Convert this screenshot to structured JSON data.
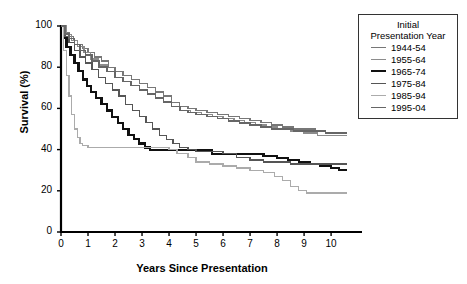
{
  "chart_data": {
    "type": "line",
    "title": "",
    "xlabel": "Years Since Presentation",
    "ylabel": "Survival (%)",
    "xlim": [
      0,
      10.7
    ],
    "ylim": [
      0,
      100
    ],
    "xticks": [
      "0",
      "1",
      "2",
      "3",
      "4",
      "5",
      "6",
      "7",
      "8",
      "9",
      "10"
    ],
    "yticks": [
      "0",
      "20",
      "40",
      "60",
      "80",
      "100"
    ],
    "grid": false,
    "step_style": "post",
    "legend": {
      "position": "top-right",
      "title_line1": "Initial",
      "title_line2": "Presentation Year",
      "entries": [
        {
          "label": "1944-54",
          "color": "#777777",
          "width": 1.3
        },
        {
          "label": "1955-64",
          "color": "#8c8c8c",
          "width": 1.3
        },
        {
          "label": "1965-74",
          "color": "#111111",
          "width": 2.2
        },
        {
          "label": "1975-84",
          "color": "#555555",
          "width": 1.3
        },
        {
          "label": "1985-94",
          "color": "#ababab",
          "width": 1.3
        },
        {
          "label": "1995-04",
          "color": "#666666",
          "width": 1.5
        }
      ]
    },
    "series": [
      {
        "name": "1944-54",
        "color": "#777777",
        "width": 1.3,
        "points": [
          [
            0,
            100
          ],
          [
            0.15,
            97
          ],
          [
            0.3,
            95
          ],
          [
            0.45,
            93
          ],
          [
            0.6,
            91
          ],
          [
            0.8,
            89
          ],
          [
            1.0,
            87
          ],
          [
            1.25,
            85
          ],
          [
            1.5,
            83
          ],
          [
            1.75,
            80
          ],
          [
            2.0,
            78
          ],
          [
            2.3,
            76
          ],
          [
            2.6,
            74
          ],
          [
            2.9,
            72
          ],
          [
            3.2,
            70
          ],
          [
            3.5,
            68
          ],
          [
            3.8,
            66
          ],
          [
            4.1,
            63
          ],
          [
            4.4,
            61
          ],
          [
            4.7,
            60
          ],
          [
            5.0,
            59
          ],
          [
            5.4,
            58
          ],
          [
            5.8,
            57
          ],
          [
            6.2,
            56
          ],
          [
            6.6,
            55
          ],
          [
            7.0,
            54
          ],
          [
            7.4,
            53
          ],
          [
            7.8,
            52
          ],
          [
            8.2,
            51
          ],
          [
            8.6,
            50
          ],
          [
            9.0,
            50
          ],
          [
            9.4,
            49
          ],
          [
            9.8,
            48
          ],
          [
            10.2,
            48
          ],
          [
            10.6,
            48
          ]
        ]
      },
      {
        "name": "1955-64",
        "color": "#8c8c8c",
        "width": 1.3,
        "points": [
          [
            0,
            100
          ],
          [
            0.2,
            96
          ],
          [
            0.4,
            93
          ],
          [
            0.6,
            90
          ],
          [
            0.85,
            87
          ],
          [
            1.1,
            84
          ],
          [
            1.4,
            81
          ],
          [
            1.7,
            78
          ],
          [
            2.0,
            75
          ],
          [
            2.3,
            73
          ],
          [
            2.6,
            71
          ],
          [
            2.9,
            69
          ],
          [
            3.2,
            67
          ],
          [
            3.5,
            65
          ],
          [
            3.8,
            63
          ],
          [
            4.1,
            61
          ],
          [
            4.4,
            59
          ],
          [
            4.8,
            58
          ],
          [
            5.2,
            57
          ],
          [
            5.6,
            56
          ],
          [
            6.0,
            55
          ],
          [
            6.4,
            54
          ],
          [
            6.8,
            53
          ],
          [
            7.2,
            52
          ],
          [
            7.6,
            51
          ],
          [
            8.0,
            50
          ],
          [
            8.5,
            49
          ],
          [
            9.0,
            48
          ],
          [
            9.5,
            47
          ],
          [
            10.0,
            47
          ],
          [
            10.6,
            47
          ]
        ]
      },
      {
        "name": "1965-74",
        "color": "#111111",
        "width": 2.2,
        "points": [
          [
            0,
            100
          ],
          [
            0.1,
            94
          ],
          [
            0.2,
            90
          ],
          [
            0.35,
            86
          ],
          [
            0.5,
            82
          ],
          [
            0.65,
            78
          ],
          [
            0.8,
            74
          ],
          [
            0.95,
            71
          ],
          [
            1.1,
            68
          ],
          [
            1.3,
            65
          ],
          [
            1.5,
            62
          ],
          [
            1.7,
            59
          ],
          [
            1.9,
            56
          ],
          [
            2.1,
            53
          ],
          [
            2.3,
            50
          ],
          [
            2.5,
            47
          ],
          [
            2.7,
            45
          ],
          [
            2.9,
            43
          ],
          [
            3.1,
            41
          ],
          [
            3.3,
            40
          ],
          [
            3.6,
            40
          ],
          [
            4.0,
            40
          ],
          [
            4.5,
            40
          ],
          [
            5.0,
            40
          ],
          [
            5.3,
            40
          ],
          [
            5.6,
            38
          ],
          [
            6.0,
            38
          ],
          [
            6.5,
            38
          ],
          [
            7.0,
            38
          ],
          [
            7.5,
            37
          ],
          [
            8.0,
            36
          ],
          [
            8.4,
            35
          ],
          [
            8.8,
            34
          ],
          [
            9.2,
            33
          ],
          [
            9.6,
            32
          ],
          [
            10.0,
            31
          ],
          [
            10.3,
            30
          ],
          [
            10.6,
            30
          ]
        ]
      },
      {
        "name": "1975-84",
        "color": "#555555",
        "width": 1.3,
        "points": [
          [
            0,
            100
          ],
          [
            0.15,
            95
          ],
          [
            0.3,
            92
          ],
          [
            0.5,
            88
          ],
          [
            0.7,
            85
          ],
          [
            0.9,
            82
          ],
          [
            1.15,
            79
          ],
          [
            1.4,
            75
          ],
          [
            1.65,
            72
          ],
          [
            1.9,
            69
          ],
          [
            2.15,
            66
          ],
          [
            2.4,
            62
          ],
          [
            2.65,
            59
          ],
          [
            2.9,
            56
          ],
          [
            3.15,
            53
          ],
          [
            3.4,
            50
          ],
          [
            3.65,
            47
          ],
          [
            3.9,
            45
          ],
          [
            4.15,
            43
          ],
          [
            4.4,
            41
          ],
          [
            4.7,
            40
          ],
          [
            5.0,
            39
          ],
          [
            5.5,
            39
          ],
          [
            6.0,
            38
          ],
          [
            6.5,
            36
          ],
          [
            7.0,
            35
          ],
          [
            7.5,
            34
          ],
          [
            8.0,
            34
          ],
          [
            8.5,
            33
          ],
          [
            9.0,
            33
          ],
          [
            9.5,
            33
          ],
          [
            10.0,
            33
          ],
          [
            10.6,
            33
          ]
        ]
      },
      {
        "name": "1985-94",
        "color": "#ababab",
        "width": 1.3,
        "points": [
          [
            0,
            100
          ],
          [
            0.1,
            88
          ],
          [
            0.2,
            76
          ],
          [
            0.3,
            66
          ],
          [
            0.4,
            57
          ],
          [
            0.5,
            50
          ],
          [
            0.6,
            46
          ],
          [
            0.7,
            43
          ],
          [
            0.8,
            42
          ],
          [
            1.0,
            41
          ],
          [
            1.5,
            41
          ],
          [
            2.0,
            41
          ],
          [
            2.5,
            41
          ],
          [
            3.0,
            41
          ],
          [
            3.5,
            41
          ],
          [
            4.0,
            40
          ],
          [
            4.3,
            38
          ],
          [
            4.7,
            36
          ],
          [
            5.0,
            34
          ],
          [
            5.5,
            33
          ],
          [
            6.0,
            32
          ],
          [
            6.5,
            31
          ],
          [
            7.0,
            30
          ],
          [
            7.5,
            29
          ],
          [
            7.9,
            27
          ],
          [
            8.2,
            25
          ],
          [
            8.5,
            22
          ],
          [
            8.8,
            20
          ],
          [
            9.1,
            19
          ],
          [
            9.6,
            19
          ],
          [
            10.1,
            19
          ],
          [
            10.6,
            19
          ]
        ]
      },
      {
        "name": "1995-04",
        "color": "#666666",
        "width": 1.5,
        "points": [
          [
            0,
            100
          ],
          [
            0.15,
            96
          ],
          [
            0.3,
            94
          ],
          [
            0.5,
            91
          ],
          [
            0.7,
            88
          ],
          [
            0.9,
            86
          ],
          [
            1.15,
            83
          ],
          [
            1.4,
            80
          ],
          [
            1.7,
            78
          ],
          [
            2.0,
            75
          ],
          [
            2.3,
            73
          ],
          [
            2.6,
            71
          ],
          [
            2.9,
            69
          ],
          [
            3.2,
            67
          ],
          [
            3.5,
            65
          ],
          [
            3.8,
            63
          ],
          [
            4.1,
            61
          ],
          [
            4.4,
            59
          ],
          [
            4.7,
            58
          ],
          [
            5.0,
            57
          ],
          [
            5.4,
            56
          ],
          [
            5.8,
            55
          ],
          [
            6.2,
            54
          ],
          [
            6.6,
            53
          ],
          [
            7.0,
            52
          ],
          [
            7.4,
            51
          ],
          [
            7.8,
            50
          ],
          [
            8.2,
            50
          ],
          [
            8.6,
            49
          ],
          [
            9.0,
            49
          ],
          [
            9.4,
            49
          ],
          [
            9.8,
            48
          ],
          [
            10.3,
            48
          ],
          [
            10.6,
            48
          ]
        ]
      }
    ]
  }
}
